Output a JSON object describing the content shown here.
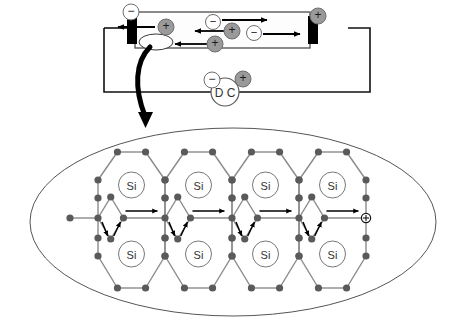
{
  "figure": {
    "background": "#ffffff"
  },
  "colors": {
    "wire": "#111111",
    "bar_outline": "#4d4d4d",
    "electrode": "#000000",
    "positive_fill": "#9a9a9a",
    "negative_fill": "#ffffff",
    "charge_outline": "#6e6e6e",
    "lattice_node": "#5a5a5a",
    "lattice_bond": "#8a8a8a",
    "ellipse_outline": "#555555",
    "arrow": "#000000",
    "si_circle_outline": "#777777",
    "big_arrow": "#000000"
  },
  "circuit": {
    "name": "semiconductor-bar-circuit",
    "bar": {
      "label": "",
      "x": 135,
      "y": 12,
      "width": 175,
      "height": 36
    },
    "terminal_left": {
      "sign": "−",
      "polarity": "negative"
    },
    "terminal_right": {
      "sign": "+",
      "polarity": "positive"
    },
    "electrodes": [
      {
        "name": "left-electrode",
        "side": "left"
      },
      {
        "name": "right-electrode",
        "side": "right"
      }
    ],
    "hole_ellipse": {
      "name": "hole-marker",
      "label": ""
    },
    "carriers": [
      {
        "id": "c1",
        "sign": "+",
        "type": "hole",
        "cx": 166,
        "cy": 27,
        "r": 8,
        "direction": "left"
      },
      {
        "id": "c2",
        "sign": "−",
        "type": "electron",
        "cx": 213,
        "cy": 22,
        "r": 7.5,
        "direction": "right"
      },
      {
        "id": "c3",
        "sign": "+",
        "type": "hole",
        "cx": 232,
        "cy": 31,
        "r": 8,
        "direction": "left"
      },
      {
        "id": "c4",
        "sign": "−",
        "type": "electron",
        "cx": 254,
        "cy": 33,
        "r": 7.5,
        "direction": "right"
      },
      {
        "id": "c5",
        "sign": "+",
        "type": "hole",
        "cx": 215,
        "cy": 44,
        "r": 8,
        "direction": "left"
      }
    ],
    "arrows": [
      {
        "id": "a1",
        "from_x": 155,
        "to_x": 118,
        "y": 27,
        "dir": "left",
        "name": "hole-drift-arrow-1"
      },
      {
        "id": "a2",
        "from_x": 222,
        "to_x": 267,
        "y": 20,
        "dir": "right",
        "name": "electron-drift-arrow-1"
      },
      {
        "id": "a3",
        "from_x": 224,
        "to_x": 195,
        "y": 31,
        "dir": "left",
        "name": "hole-drift-arrow-2"
      },
      {
        "id": "a4",
        "from_x": 263,
        "to_x": 300,
        "y": 34,
        "dir": "right",
        "name": "electron-drift-arrow-2"
      },
      {
        "id": "a5",
        "from_x": 207,
        "to_x": 175,
        "y": 44,
        "dir": "left",
        "name": "hole-drift-arrow-3"
      }
    ],
    "source": {
      "name": "dc-source",
      "label": "D C",
      "minus_sign": "−",
      "plus_sign": "+"
    }
  },
  "pointer": {
    "name": "zoom-callout-arrow",
    "description": "thick curved arrow from hole in bar down into lattice close-up"
  },
  "lattice": {
    "name": "silicon-lattice-closeup",
    "atom_label": "Si",
    "atoms_top_row": [
      "Si",
      "Si",
      "Si",
      "Si"
    ],
    "atoms_bottom_row": [
      "Si",
      "Si",
      "Si",
      "Si"
    ],
    "hole_symbol": "⊕",
    "hole_name": "hole-in-lattice",
    "bond_arrow_count": 12,
    "geometry": {
      "ellipse_cx": 233,
      "ellipse_cy": 222,
      "ellipse_rx": 203,
      "ellipse_ry": 94,
      "cell_width": 67,
      "x0": 98,
      "mid_y": 218,
      "top_center_y": 177,
      "bottom_center_y": 262
    }
  }
}
